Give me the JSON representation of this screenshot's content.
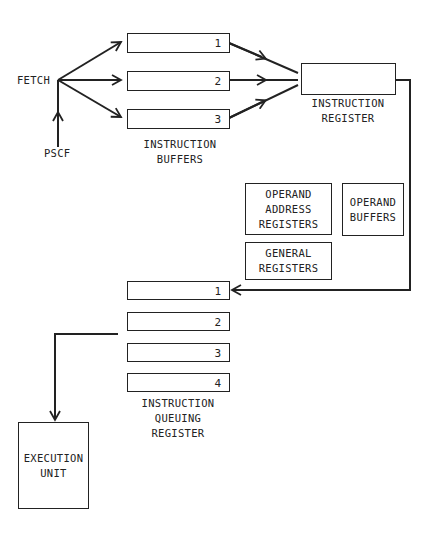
{
  "fetch": {
    "label": "FETCH"
  },
  "pscf": {
    "label": "PSCF"
  },
  "instruction_buffers": {
    "label": "INSTRUCTION\nBUFFERS",
    "slots": [
      "1",
      "2",
      "3"
    ]
  },
  "instruction_register": {
    "label": "INSTRUCTION\nREGISTER"
  },
  "operand_address_registers": {
    "label": "OPERAND\nADDRESS\nREGISTERS"
  },
  "operand_buffers": {
    "label": "OPERAND\nBUFFERS"
  },
  "general_registers": {
    "label": "GENERAL\nREGISTERS"
  },
  "instruction_queuing_register": {
    "label": "INSTRUCTION\nQUEUING\nREGISTER",
    "slots": [
      "1",
      "2",
      "3",
      "4"
    ]
  },
  "execution_unit": {
    "label": "EXECUTION\nUNIT"
  },
  "colors": {
    "line": "#222222",
    "background": "#ffffff"
  }
}
